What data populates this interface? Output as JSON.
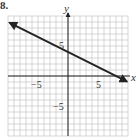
{
  "problem_number": "8.",
  "chart_data": {
    "type": "line",
    "title": "",
    "xlabel": "x",
    "ylabel": "y",
    "xlim": [
      -10,
      10
    ],
    "ylim": [
      -10,
      10
    ],
    "grid": true,
    "grid_step": 1,
    "tick_labels": {
      "x": [
        {
          "value": -5,
          "label": "−5"
        },
        {
          "value": 5,
          "label": "5"
        }
      ],
      "y": [
        {
          "value": 5,
          "label": "5"
        },
        {
          "value": -5,
          "label": "−5"
        }
      ]
    },
    "series": [
      {
        "name": "line",
        "equation": "y = -x/2 + 4",
        "slope": -0.5,
        "y_intercept": 4,
        "x_intercept": 8,
        "x": [
          -9.7,
          9.8
        ],
        "y": [
          8.85,
          -0.9
        ],
        "arrows": "both"
      }
    ],
    "colors": {
      "grid": "#bdbdbd",
      "axis": "#222222",
      "line": "#222222"
    }
  }
}
